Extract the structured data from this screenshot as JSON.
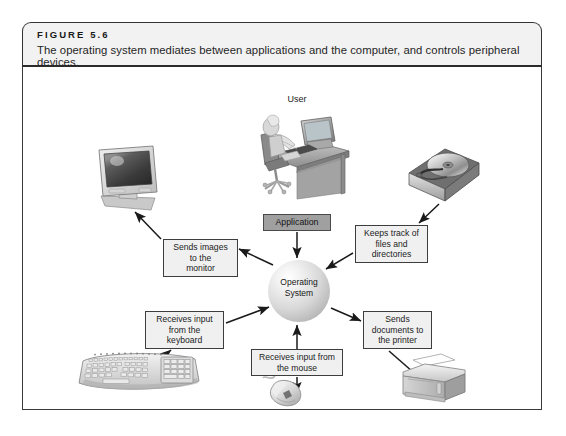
{
  "figure": {
    "number_label": "FIGURE 5.6",
    "caption": "The operating system mediates between applications and the computer, and controls peripheral devices."
  },
  "diagram": {
    "center_node": {
      "label_line1": "Operating",
      "label_line2": "System",
      "name": "operating-system-sphere"
    },
    "application_box": {
      "label": "Application"
    },
    "user_caption": "User",
    "labels": [
      {
        "id": "monitor",
        "line1": "Sends images",
        "line2": "to the",
        "line3": "monitor"
      },
      {
        "id": "hdd",
        "line1": "Keeps track of",
        "line2": "files and",
        "line3": "directories"
      },
      {
        "id": "keyboard",
        "line1": "Receives input",
        "line2": "from the",
        "line3": "keyboard"
      },
      {
        "id": "printer",
        "line1": "Sends",
        "line2": "documents to",
        "line3": "the printer"
      },
      {
        "id": "mouse",
        "line1": "Receives input from",
        "line2": "the mouse",
        "line3": ""
      }
    ],
    "devices": [
      {
        "id": "monitor",
        "name": "crt-monitor-image"
      },
      {
        "id": "hard-disk",
        "name": "hard-disk-drive-image"
      },
      {
        "id": "keyboard",
        "name": "ergonomic-keyboard-image"
      },
      {
        "id": "mouse",
        "name": "computer-mouse-image"
      },
      {
        "id": "printer",
        "name": "laser-printer-image"
      },
      {
        "id": "user",
        "name": "user-at-desk-image"
      }
    ],
    "colors": {
      "frame_border": "#3a3a3a",
      "header_fill": "#f2f2f2",
      "label_fill": "#f0f0f0",
      "application_fill": "#a0a0a0",
      "arrow": "#1a1a1a"
    }
  }
}
